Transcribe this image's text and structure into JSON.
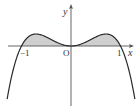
{
  "figure": {
    "axes": {
      "x_label": "x",
      "y_label": "y",
      "origin_label": "O",
      "tick_labels": [
        "−1",
        "1"
      ]
    },
    "curve": {
      "shape": "y = k·x²(1 − x²)",
      "zeros": [
        -1,
        0,
        1
      ],
      "local_maxima_x": [
        -0.707,
        0.707
      ],
      "local_minimum_x": 0
    },
    "shaded_region": {
      "from": -1,
      "to": 1,
      "fill": "#cfcfcf"
    },
    "colors": {
      "curve": "#2a2a2a",
      "axis": "#555555",
      "shade": "#cfcfcf"
    }
  }
}
